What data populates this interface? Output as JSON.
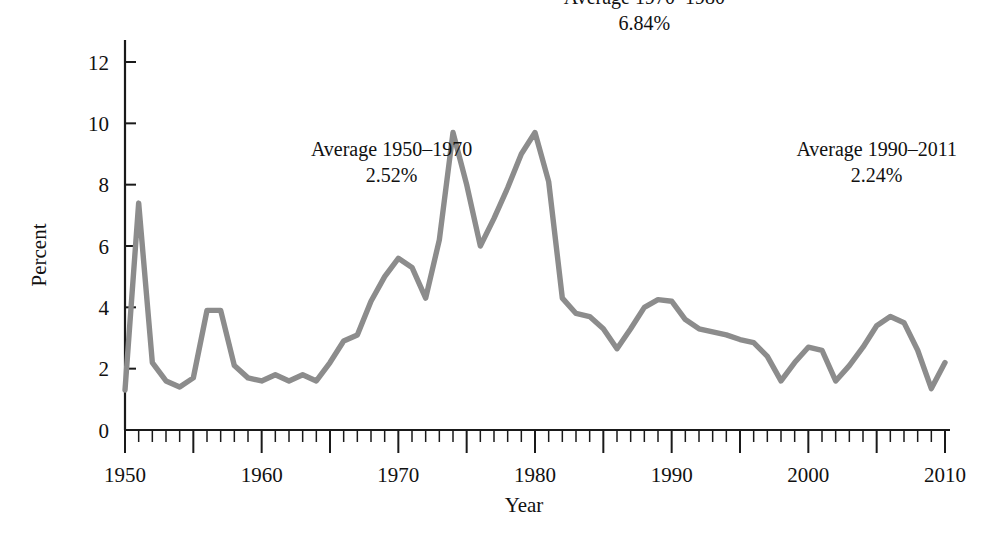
{
  "chart_data": {
    "type": "line",
    "title": "",
    "xlabel": "Year",
    "ylabel": "Percent",
    "xlim": [
      1950,
      2010
    ],
    "ylim": [
      0,
      13
    ],
    "grid": false,
    "legend": "none",
    "line_color": "#8c8c8c",
    "axis_color": "#1a1a1a",
    "background_color": "#ffffff",
    "y_ticks": [
      0,
      2,
      4,
      6,
      8,
      10,
      12
    ],
    "y_tick_labels": [
      "0",
      "2",
      "4",
      "6",
      "8",
      "10",
      "12"
    ],
    "x_ticks": [
      1950,
      1960,
      1970,
      1980,
      1990,
      2000,
      2010
    ],
    "x_tick_labels": [
      "1950",
      "1960",
      "1970",
      "1980",
      "1990",
      "2000",
      "2010"
    ],
    "x_minor_tick_step": 1,
    "x_major_tick_step": 5,
    "series": [
      {
        "name": "Inflation rate",
        "x": [
          1950,
          1951,
          1952,
          1953,
          1954,
          1955,
          1956,
          1957,
          1958,
          1959,
          1960,
          1961,
          1962,
          1963,
          1964,
          1965,
          1966,
          1967,
          1968,
          1969,
          1970,
          1971,
          1972,
          1973,
          1974,
          1975,
          1976,
          1977,
          1978,
          1979,
          1980,
          1981,
          1982,
          1983,
          1984,
          1985,
          1986,
          1987,
          1988,
          1989,
          1990,
          1991,
          1992,
          1993,
          1994,
          1995,
          1996,
          1997,
          1998,
          1999,
          2000,
          2001,
          2002,
          2003,
          2004,
          2005,
          2006,
          2007,
          2008,
          2009,
          2010
        ],
        "values": [
          1.3,
          7.4,
          2.2,
          1.6,
          1.4,
          1.7,
          3.9,
          3.9,
          2.1,
          1.7,
          1.6,
          1.8,
          1.6,
          1.8,
          1.6,
          2.2,
          2.9,
          3.1,
          4.2,
          5.0,
          5.6,
          5.3,
          4.3,
          6.2,
          9.7,
          8.0,
          6.0,
          6.9,
          7.9,
          9.0,
          9.7,
          8.1,
          4.3,
          3.8,
          3.7,
          3.3,
          2.65,
          3.3,
          4.0,
          4.25,
          4.2,
          3.6,
          3.3,
          3.2,
          3.1,
          2.95,
          2.85,
          2.4,
          1.6,
          2.2,
          2.7,
          2.6,
          1.6,
          2.1,
          2.7,
          3.4,
          3.7,
          3.5,
          2.6,
          1.35,
          2.2
        ]
      }
    ],
    "annotations": [
      {
        "id": "avg-1950-1970",
        "line1": "Average 1950–1970",
        "line2": "2.52%",
        "x_year": 1969.5,
        "y_value": 8.95
      },
      {
        "id": "avg-1970-1980",
        "line1": "Average 1970–1980",
        "line2": "6.84%",
        "x_year": 1988.0,
        "y_value": 13.9
      },
      {
        "id": "avg-1990-2011",
        "line1": "Average 1990–2011",
        "line2": "2.24%",
        "x_year": 2005.0,
        "y_value": 8.95
      }
    ]
  }
}
